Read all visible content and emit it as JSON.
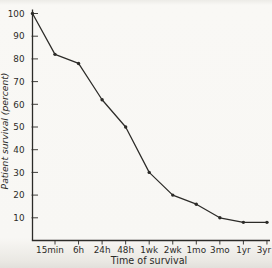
{
  "figure": {
    "background": "#f8f7f4",
    "ink": "#2c2b28",
    "marker_color": "#2c2b28"
  },
  "chart_data": {
    "type": "line",
    "title": "",
    "xlabel": "Time of survival",
    "ylabel": "Patient survival (percent)",
    "x_tick_labels": [
      "15min",
      "6h",
      "24h",
      "48h",
      "1wk",
      "2wk",
      "1mo",
      "3mo",
      "1yr",
      "3yr"
    ],
    "y_tick_labels": [
      10,
      20,
      30,
      40,
      50,
      60,
      70,
      80,
      90,
      100
    ],
    "ylim": [
      0,
      100
    ],
    "grid": false,
    "legend": false,
    "marker": "dot",
    "series": [
      {
        "name": "patient survival",
        "x": [
          "0",
          "15min",
          "6h",
          "24h",
          "48h",
          "1wk",
          "2wk",
          "1mo",
          "3mo",
          "1yr",
          "3yr"
        ],
        "values": [
          100,
          82,
          78,
          62,
          50,
          30,
          20,
          16,
          10,
          8,
          8
        ]
      }
    ]
  }
}
